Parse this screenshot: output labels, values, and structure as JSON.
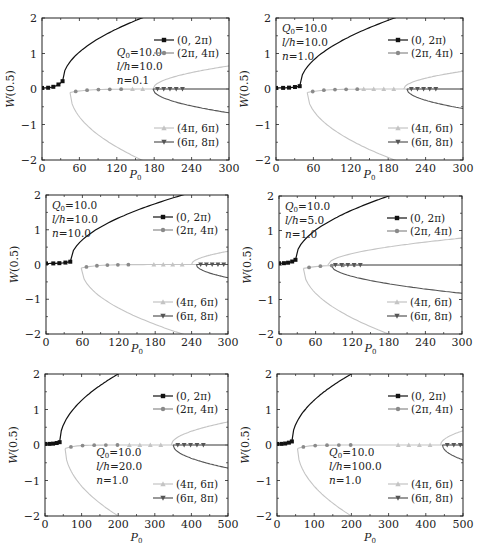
{
  "figure": {
    "ylabel": "W(0.5)",
    "xlabel": "P0",
    "colors": {
      "mode1": "#111111",
      "mode2": "#8a8a8a",
      "mode3": "#c4c4c4",
      "mode4": "#555555",
      "axis": "#222222"
    },
    "legend": [
      {
        "label": "(0, 2π)",
        "marker": "square",
        "series": "mode1"
      },
      {
        "label": "(2π, 4π)",
        "marker": "circle",
        "series": "mode2"
      },
      {
        "label": "(4π, 6π)",
        "marker": "triangle-up",
        "series": "mode3"
      },
      {
        "label": "(6π, 8π)",
        "marker": "triangle-down",
        "series": "mode4"
      }
    ]
  },
  "chart_data": [
    {
      "type": "line",
      "id": "a",
      "title": "",
      "xlabel": "P0",
      "ylabel": "W(0.5)",
      "xlim": [
        0,
        300
      ],
      "ylim": [
        -2,
        2
      ],
      "xticks": [
        0,
        60,
        120,
        180,
        240,
        300
      ],
      "yticks": [
        -2,
        -1,
        0,
        1,
        2
      ],
      "params": [
        "Q0=10.0",
        "l/h=10.0",
        "n=0.1"
      ],
      "params_pos": "upper-middle",
      "critical_loads": {
        "mode1": 33,
        "mode2": 45,
        "mode3": 178,
        "mode4": 178
      },
      "series": [
        {
          "name": "(0, 2π)",
          "points": [
            [
              0,
              0.03
            ],
            [
              10,
              0.04
            ],
            [
              20,
              0.06
            ],
            [
              33,
              0.22
            ],
            [
              60,
              0.85
            ],
            [
              100,
              1.4
            ],
            [
              160,
              2.0
            ]
          ]
        },
        {
          "name": "(2π, 4π)",
          "points": [
            [
              45,
              -0.08
            ],
            [
              60,
              -0.03
            ],
            [
              100,
              -0.01
            ],
            [
              160,
              -2.0
            ]
          ]
        },
        {
          "name": "(4π, 6π)",
          "points": [
            [
              120,
              0.0
            ],
            [
              178,
              0.0
            ],
            [
              240,
              0.45
            ],
            [
              300,
              0.65
            ]
          ]
        },
        {
          "name": "(6π, 8π)",
          "points": [
            [
              178,
              0.0
            ],
            [
              220,
              0.0
            ],
            [
              300,
              -0.67
            ]
          ]
        }
      ],
      "legend_position": "split-right"
    },
    {
      "type": "line",
      "id": "b",
      "xlim": [
        0,
        300
      ],
      "ylim": [
        -2,
        2
      ],
      "xticks": [
        0,
        60,
        120,
        180,
        240,
        300
      ],
      "yticks": [
        -2,
        -1,
        0,
        1,
        2
      ],
      "params": [
        "Q0=10.0",
        "l/h=10.0",
        "n=1.0"
      ],
      "params_pos": "upper-left",
      "critical_loads": {
        "mode1": 38,
        "mode2": 50,
        "mode3": 205,
        "mode4": 210
      },
      "series": [
        {
          "name": "(0, 2π)",
          "points": [
            [
              0,
              0.03
            ],
            [
              10,
              0.03
            ],
            [
              20,
              0.04
            ],
            [
              33,
              0.08
            ],
            [
              38,
              0.12
            ],
            [
              60,
              0.7
            ],
            [
              120,
              1.4
            ],
            [
              190,
              2.0
            ]
          ]
        },
        {
          "name": "(2π, 4π)",
          "points": [
            [
              50,
              -0.1
            ],
            [
              60,
              -0.05
            ],
            [
              190,
              -2.0
            ]
          ]
        },
        {
          "name": "(4π, 6π)",
          "points": [
            [
              205,
              0.0
            ],
            [
              300,
              0.5
            ]
          ]
        },
        {
          "name": "(6π, 8π)",
          "points": [
            [
              210,
              -0.02
            ],
            [
              300,
              -0.55
            ]
          ]
        }
      ],
      "legend_position": "split-right"
    },
    {
      "type": "line",
      "id": "c",
      "xlim": [
        0,
        300
      ],
      "ylim": [
        -2,
        2
      ],
      "xticks": [
        0,
        60,
        120,
        180,
        240,
        300
      ],
      "yticks": [
        -2,
        -1,
        0,
        1,
        2
      ],
      "params": [
        "Q0=10.0",
        "l/h=10.0",
        "n=10.0"
      ],
      "params_pos": "upper-left",
      "critical_loads": {
        "mode1": 40,
        "mode2": 58,
        "mode3": 240,
        "mode4": 248
      },
      "series": [
        {
          "name": "(0, 2π)",
          "points": [
            [
              0,
              0.03
            ],
            [
              10,
              0.03
            ],
            [
              20,
              0.04
            ],
            [
              36,
              0.08
            ],
            [
              40,
              0.1
            ],
            [
              60,
              0.6
            ],
            [
              120,
              1.3
            ],
            [
              225,
              2.0
            ]
          ]
        },
        {
          "name": "(2π, 4π)",
          "points": [
            [
              58,
              -0.15
            ],
            [
              70,
              -0.05
            ],
            [
              225,
              -2.0
            ]
          ]
        },
        {
          "name": "(4π, 6π)",
          "points": [
            [
              240,
              0.0
            ],
            [
              300,
              0.38
            ]
          ]
        },
        {
          "name": "(6π, 8π)",
          "points": [
            [
              248,
              -0.02
            ],
            [
              300,
              -0.38
            ]
          ]
        }
      ],
      "legend_position": "split-right"
    },
    {
      "type": "line",
      "id": "d",
      "xlim": [
        0,
        300
      ],
      "ylim": [
        -2,
        2
      ],
      "xticks": [
        0,
        60,
        120,
        180,
        240,
        300
      ],
      "yticks": [
        -2,
        -1,
        0,
        1,
        2
      ],
      "params": [
        "Q0=10.0",
        "l/h=5.0",
        "n=1.0"
      ],
      "params_pos": "upper-left",
      "critical_loads": {
        "mode1": 27,
        "mode2": 40,
        "mode3": 80,
        "mode4": 85
      },
      "series": [
        {
          "name": "(0, 2π)",
          "points": [
            [
              0,
              0.05
            ],
            [
              10,
              0.06
            ],
            [
              20,
              0.08
            ],
            [
              27,
              0.15
            ],
            [
              60,
              0.9
            ],
            [
              120,
              1.5
            ],
            [
              180,
              2.0
            ]
          ]
        },
        {
          "name": "(2π, 4π)",
          "points": [
            [
              40,
              -0.15
            ],
            [
              50,
              -0.05
            ],
            [
              180,
              -2.0
            ]
          ]
        },
        {
          "name": "(4π, 6π)",
          "points": [
            [
              80,
              0.0
            ],
            [
              180,
              0.55
            ],
            [
              300,
              0.78
            ]
          ]
        },
        {
          "name": "(6π, 8π)",
          "points": [
            [
              85,
              -0.02
            ],
            [
              180,
              -0.5
            ],
            [
              300,
              -0.82
            ]
          ]
        }
      ],
      "legend_position": "split-right"
    },
    {
      "type": "line",
      "id": "e",
      "xlim": [
        0,
        500
      ],
      "ylim": [
        -2,
        2
      ],
      "xticks": [
        0,
        100,
        200,
        300,
        400,
        500
      ],
      "yticks": [
        -2,
        -1,
        0,
        1,
        2
      ],
      "params": [
        "Q0=10.0",
        "l/h=20.0",
        "n=1.0"
      ],
      "params_pos": "middle",
      "critical_loads": {
        "mode1": 40,
        "mode2": 55,
        "mode3": 345,
        "mode4": 350
      },
      "series": [
        {
          "name": "(0, 2π)",
          "points": [
            [
              0,
              0.03
            ],
            [
              10,
              0.03
            ],
            [
              20,
              0.04
            ],
            [
              35,
              0.08
            ],
            [
              40,
              0.1
            ],
            [
              80,
              0.9
            ],
            [
              140,
              1.5
            ],
            [
              200,
              2.0
            ]
          ]
        },
        {
          "name": "(2π, 4π)",
          "points": [
            [
              55,
              -0.1
            ],
            [
              80,
              -0.03
            ],
            [
              200,
              -2.0
            ]
          ]
        },
        {
          "name": "(4π, 6π)",
          "points": [
            [
              345,
              0.0
            ],
            [
              500,
              0.65
            ]
          ]
        },
        {
          "name": "(6π, 8π)",
          "points": [
            [
              350,
              -0.02
            ],
            [
              500,
              -0.65
            ]
          ]
        }
      ],
      "legend_position": "split-right"
    },
    {
      "type": "line",
      "id": "f",
      "xlim": [
        0,
        500
      ],
      "ylim": [
        -2,
        2
      ],
      "xticks": [
        0,
        100,
        200,
        300,
        400,
        500
      ],
      "yticks": [
        -2,
        -1,
        0,
        1,
        2
      ],
      "params": [
        "Q0=10.0",
        "l/h=100.0",
        "n=1.0"
      ],
      "params_pos": "middle",
      "critical_loads": {
        "mode1": 40,
        "mode2": 55,
        "mode3": 440,
        "mode4": 445
      },
      "series": [
        {
          "name": "(0, 2π)",
          "points": [
            [
              0,
              0.03
            ],
            [
              10,
              0.03
            ],
            [
              30,
              0.06
            ],
            [
              40,
              0.1
            ],
            [
              80,
              0.9
            ],
            [
              140,
              1.5
            ],
            [
              200,
              2.0
            ]
          ]
        },
        {
          "name": "(2π, 4π)",
          "points": [
            [
              55,
              -0.1
            ],
            [
              80,
              -0.03
            ],
            [
              200,
              -2.0
            ]
          ]
        },
        {
          "name": "(4π, 6π)",
          "points": [
            [
              440,
              0.0
            ],
            [
              500,
              0.4
            ]
          ]
        },
        {
          "name": "(6π, 8π)",
          "points": [
            [
              445,
              -0.02
            ],
            [
              500,
              -0.42
            ]
          ]
        }
      ],
      "legend_position": "split-right"
    }
  ]
}
